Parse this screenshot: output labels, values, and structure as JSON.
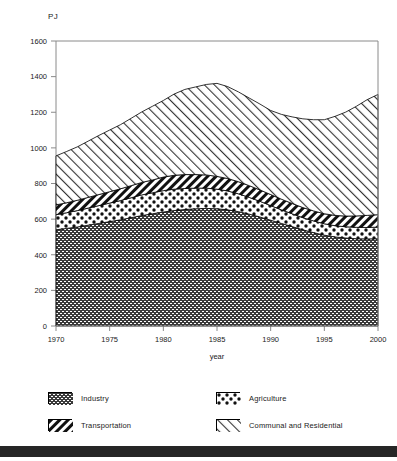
{
  "axes": {
    "y_unit": "PJ",
    "x_title": "year",
    "y_ticks": [
      "1600",
      "1400",
      "1200",
      "1000",
      "800",
      "600",
      "400",
      "200",
      "0"
    ],
    "x_ticks": [
      "1970",
      "1975",
      "1980",
      "1985",
      "1990",
      "1995",
      "2000"
    ]
  },
  "legend": {
    "industry": "Industry",
    "agriculture": "Agriculture",
    "transportation": "Transportation",
    "communal": "Communal and Residential"
  },
  "colors": {
    "ink": "#000000",
    "axis": "#8a8a8a",
    "industry_fill": "#3a3a3a",
    "bottom_bar": "#262626"
  },
  "chart_data": {
    "type": "area",
    "title": "",
    "subtitle": "",
    "xlabel": "year",
    "ylabel": "PJ",
    "stacked": true,
    "grid": false,
    "legend_position": "bottom",
    "xlim": [
      1970,
      2000
    ],
    "ylim": [
      0,
      1600
    ],
    "x": [
      1970,
      1971,
      1972,
      1973,
      1974,
      1975,
      1976,
      1977,
      1978,
      1979,
      1980,
      1981,
      1982,
      1983,
      1984,
      1985,
      1986,
      1987,
      1988,
      1989,
      1990,
      1991,
      1992,
      1993,
      1994,
      1995,
      1996,
      1997,
      1998,
      1999,
      2000
    ],
    "series": [
      {
        "name": "Industry",
        "values": [
          540,
          548,
          556,
          566,
          576,
          586,
          596,
          608,
          620,
          630,
          640,
          648,
          654,
          658,
          660,
          658,
          652,
          642,
          628,
          612,
          594,
          576,
          558,
          540,
          524,
          510,
          500,
          494,
          490,
          489,
          490
        ]
      },
      {
        "name": "Agriculture",
        "values": [
          85,
          88,
          92,
          96,
          100,
          104,
          108,
          112,
          116,
          118,
          120,
          120,
          118,
          116,
          114,
          110,
          106,
          100,
          94,
          88,
          82,
          76,
          72,
          68,
          66,
          64,
          63,
          63,
          64,
          64,
          65
        ]
      },
      {
        "name": "Transportation",
        "values": [
          55,
          56,
          58,
          60,
          62,
          64,
          66,
          68,
          70,
          72,
          76,
          78,
          78,
          76,
          74,
          72,
          70,
          68,
          66,
          64,
          62,
          60,
          58,
          57,
          56,
          56,
          58,
          60,
          64,
          68,
          70
        ]
      },
      {
        "name": "Communal and Residential",
        "values": [
          275,
          288,
          300,
          316,
          332,
          346,
          360,
          378,
          396,
          414,
          430,
          456,
          478,
          492,
          508,
          522,
          516,
          504,
          492,
          482,
          472,
          476,
          486,
          498,
          512,
          528,
          556,
          584,
          616,
          650,
          675
        ]
      }
    ],
    "totals": [
      955,
      980,
      1006,
      1038,
      1070,
      1100,
      1130,
      1166,
      1202,
      1234,
      1266,
      1302,
      1328,
      1342,
      1356,
      1362,
      1344,
      1314,
      1280,
      1246,
      1210,
      1188,
      1174,
      1163,
      1158,
      1158,
      1177,
      1201,
      1234,
      1271,
      1300
    ]
  }
}
